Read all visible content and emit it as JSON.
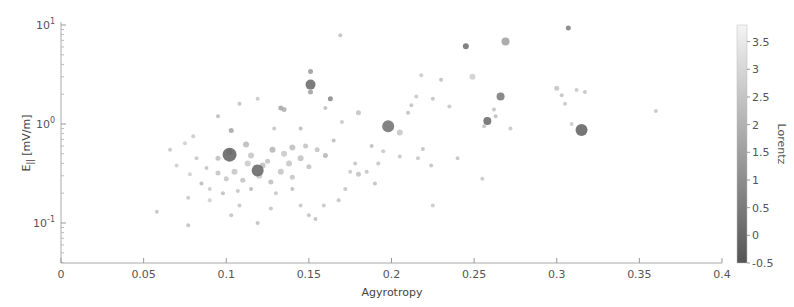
{
  "chart_data": {
    "type": "scatter",
    "title": "",
    "xlabel": "Agyrotropy",
    "ylabel": "E_|| [mV/m]",
    "xlim": [
      0,
      0.4
    ],
    "ylim": [
      0.04,
      10
    ],
    "yscale": "log",
    "grid": false,
    "x_ticks": [
      "0",
      "0.05",
      "0.1",
      "0.15",
      "0.2",
      "0.25",
      "0.3",
      "0.35",
      "0.4"
    ],
    "y_ticks": [
      "10^-1",
      "10^0",
      "10^1"
    ],
    "colorbar": {
      "label": "Lorentz",
      "range": [
        -0.5,
        3.8
      ],
      "ticks": [
        "-0.5",
        "0",
        "0.5",
        "1",
        "1.5",
        "2",
        "2.5",
        "3",
        "3.5"
      ],
      "colormap": "gray (dark = low, light = high)"
    },
    "points": [
      {
        "x": 0.102,
        "y": 0.49,
        "c": 0.0,
        "s": 7
      },
      {
        "x": 0.119,
        "y": 0.34,
        "c": 0.1,
        "s": 6
      },
      {
        "x": 0.151,
        "y": 2.5,
        "c": 0.2,
        "s": 5
      },
      {
        "x": 0.198,
        "y": 0.95,
        "c": 0.4,
        "s": 6
      },
      {
        "x": 0.258,
        "y": 1.07,
        "c": 0.2,
        "s": 4
      },
      {
        "x": 0.266,
        "y": 1.9,
        "c": 0.6,
        "s": 4
      },
      {
        "x": 0.315,
        "y": 0.87,
        "c": 0.0,
        "s": 6
      },
      {
        "x": 0.245,
        "y": 6.1,
        "c": 0.3,
        "s": 3
      },
      {
        "x": 0.269,
        "y": 6.8,
        "c": 1.6,
        "s": 4
      },
      {
        "x": 0.307,
        "y": 9.3,
        "c": 0.8,
        "s": 2.5
      },
      {
        "x": 0.151,
        "y": 3.4,
        "c": 1.5,
        "s": 2.5
      },
      {
        "x": 0.151,
        "y": 2.1,
        "c": 1.6,
        "s": 2.5
      },
      {
        "x": 0.163,
        "y": 1.8,
        "c": 1.0,
        "s": 2.5
      },
      {
        "x": 0.169,
        "y": 7.9,
        "c": 2.4,
        "s": 2
      },
      {
        "x": 0.135,
        "y": 1.4,
        "c": 2.0,
        "s": 2.5
      },
      {
        "x": 0.133,
        "y": 1.45,
        "c": 1.8,
        "s": 2.5
      },
      {
        "x": 0.103,
        "y": 0.86,
        "c": 1.8,
        "s": 2.5
      },
      {
        "x": 0.102,
        "y": 0.52,
        "c": 2.0,
        "s": 3
      },
      {
        "x": 0.095,
        "y": 1.2,
        "c": 2.3,
        "s": 2
      },
      {
        "x": 0.112,
        "y": 0.62,
        "c": 2.3,
        "s": 3
      },
      {
        "x": 0.122,
        "y": 0.38,
        "c": 2.4,
        "s": 3
      },
      {
        "x": 0.128,
        "y": 0.55,
        "c": 2.2,
        "s": 3
      },
      {
        "x": 0.14,
        "y": 0.58,
        "c": 2.4,
        "s": 3
      },
      {
        "x": 0.145,
        "y": 0.45,
        "c": 2.5,
        "s": 3
      },
      {
        "x": 0.133,
        "y": 0.33,
        "c": 2.6,
        "s": 3
      },
      {
        "x": 0.113,
        "y": 0.4,
        "c": 2.7,
        "s": 3
      },
      {
        "x": 0.105,
        "y": 0.33,
        "c": 2.6,
        "s": 3
      },
      {
        "x": 0.095,
        "y": 0.32,
        "c": 2.5,
        "s": 2.5
      },
      {
        "x": 0.1,
        "y": 0.28,
        "c": 2.6,
        "s": 2.5
      },
      {
        "x": 0.11,
        "y": 0.27,
        "c": 2.5,
        "s": 2.5
      },
      {
        "x": 0.12,
        "y": 0.3,
        "c": 2.7,
        "s": 3
      },
      {
        "x": 0.127,
        "y": 0.26,
        "c": 2.4,
        "s": 2.5
      },
      {
        "x": 0.14,
        "y": 0.29,
        "c": 2.6,
        "s": 2.5
      },
      {
        "x": 0.15,
        "y": 0.37,
        "c": 2.5,
        "s": 2.5
      },
      {
        "x": 0.155,
        "y": 0.55,
        "c": 2.5,
        "s": 2.5
      },
      {
        "x": 0.16,
        "y": 0.48,
        "c": 2.2,
        "s": 2.5
      },
      {
        "x": 0.088,
        "y": 0.36,
        "c": 2.5,
        "s": 2
      },
      {
        "x": 0.085,
        "y": 0.25,
        "c": 2.3,
        "s": 2
      },
      {
        "x": 0.09,
        "y": 0.22,
        "c": 2.7,
        "s": 2
      },
      {
        "x": 0.098,
        "y": 0.2,
        "c": 2.4,
        "s": 2
      },
      {
        "x": 0.107,
        "y": 0.21,
        "c": 2.5,
        "s": 2
      },
      {
        "x": 0.115,
        "y": 0.22,
        "c": 2.2,
        "s": 2
      },
      {
        "x": 0.13,
        "y": 0.2,
        "c": 2.6,
        "s": 2
      },
      {
        "x": 0.14,
        "y": 0.22,
        "c": 2.4,
        "s": 2
      },
      {
        "x": 0.078,
        "y": 0.31,
        "c": 2.8,
        "s": 2
      },
      {
        "x": 0.082,
        "y": 0.45,
        "c": 2.6,
        "s": 2
      },
      {
        "x": 0.075,
        "y": 0.64,
        "c": 2.8,
        "s": 2
      },
      {
        "x": 0.066,
        "y": 0.55,
        "c": 2.6,
        "s": 2
      },
      {
        "x": 0.058,
        "y": 0.13,
        "c": 2.5,
        "s": 2
      },
      {
        "x": 0.077,
        "y": 0.095,
        "c": 2.4,
        "s": 2
      },
      {
        "x": 0.077,
        "y": 0.18,
        "c": 2.6,
        "s": 2
      },
      {
        "x": 0.09,
        "y": 0.17,
        "c": 2.8,
        "s": 2
      },
      {
        "x": 0.103,
        "y": 0.12,
        "c": 2.5,
        "s": 2
      },
      {
        "x": 0.108,
        "y": 0.15,
        "c": 2.6,
        "s": 2
      },
      {
        "x": 0.119,
        "y": 0.1,
        "c": 2.4,
        "s": 2
      },
      {
        "x": 0.127,
        "y": 0.14,
        "c": 2.5,
        "s": 2
      },
      {
        "x": 0.145,
        "y": 0.15,
        "c": 2.6,
        "s": 2
      },
      {
        "x": 0.15,
        "y": 0.12,
        "c": 2.5,
        "s": 2
      },
      {
        "x": 0.154,
        "y": 0.11,
        "c": 2.4,
        "s": 2
      },
      {
        "x": 0.159,
        "y": 0.15,
        "c": 2.6,
        "s": 2
      },
      {
        "x": 0.168,
        "y": 0.17,
        "c": 2.5,
        "s": 2
      },
      {
        "x": 0.172,
        "y": 0.22,
        "c": 2.5,
        "s": 2
      },
      {
        "x": 0.18,
        "y": 0.31,
        "c": 2.5,
        "s": 2.5
      },
      {
        "x": 0.175,
        "y": 0.33,
        "c": 2.6,
        "s": 2
      },
      {
        "x": 0.19,
        "y": 0.25,
        "c": 2.4,
        "s": 2
      },
      {
        "x": 0.192,
        "y": 0.4,
        "c": 2.5,
        "s": 2
      },
      {
        "x": 0.195,
        "y": 0.53,
        "c": 2.6,
        "s": 2
      },
      {
        "x": 0.205,
        "y": 0.82,
        "c": 2.6,
        "s": 3
      },
      {
        "x": 0.21,
        "y": 1.3,
        "c": 2.4,
        "s": 2
      },
      {
        "x": 0.212,
        "y": 1.55,
        "c": 2.5,
        "s": 2
      },
      {
        "x": 0.215,
        "y": 1.9,
        "c": 2.6,
        "s": 2
      },
      {
        "x": 0.218,
        "y": 3.1,
        "c": 2.7,
        "s": 2
      },
      {
        "x": 0.225,
        "y": 1.8,
        "c": 2.5,
        "s": 2
      },
      {
        "x": 0.23,
        "y": 2.8,
        "c": 2.4,
        "s": 2
      },
      {
        "x": 0.235,
        "y": 1.5,
        "c": 2.6,
        "s": 2
      },
      {
        "x": 0.24,
        "y": 0.45,
        "c": 2.5,
        "s": 2
      },
      {
        "x": 0.249,
        "y": 3.0,
        "c": 2.8,
        "s": 3
      },
      {
        "x": 0.256,
        "y": 0.95,
        "c": 2.5,
        "s": 2
      },
      {
        "x": 0.262,
        "y": 1.4,
        "c": 2.5,
        "s": 2
      },
      {
        "x": 0.263,
        "y": 1.2,
        "c": 2.4,
        "s": 2
      },
      {
        "x": 0.255,
        "y": 0.28,
        "c": 2.6,
        "s": 2
      },
      {
        "x": 0.272,
        "y": 0.9,
        "c": 2.6,
        "s": 2
      },
      {
        "x": 0.225,
        "y": 0.15,
        "c": 2.7,
        "s": 2
      },
      {
        "x": 0.224,
        "y": 0.38,
        "c": 2.5,
        "s": 2
      },
      {
        "x": 0.219,
        "y": 0.56,
        "c": 2.5,
        "s": 2
      },
      {
        "x": 0.216,
        "y": 0.45,
        "c": 2.6,
        "s": 2
      },
      {
        "x": 0.205,
        "y": 0.47,
        "c": 2.6,
        "s": 2
      },
      {
        "x": 0.188,
        "y": 0.6,
        "c": 2.4,
        "s": 2
      },
      {
        "x": 0.18,
        "y": 1.3,
        "c": 2.5,
        "s": 2.5
      },
      {
        "x": 0.17,
        "y": 1.05,
        "c": 2.6,
        "s": 2
      },
      {
        "x": 0.165,
        "y": 0.68,
        "c": 2.3,
        "s": 2
      },
      {
        "x": 0.178,
        "y": 0.4,
        "c": 2.5,
        "s": 2
      },
      {
        "x": 0.185,
        "y": 0.33,
        "c": 2.5,
        "s": 2
      },
      {
        "x": 0.16,
        "y": 1.45,
        "c": 2.4,
        "s": 2
      },
      {
        "x": 0.145,
        "y": 0.9,
        "c": 2.3,
        "s": 2
      },
      {
        "x": 0.129,
        "y": 0.9,
        "c": 2.5,
        "s": 2
      },
      {
        "x": 0.119,
        "y": 1.8,
        "c": 2.6,
        "s": 2
      },
      {
        "x": 0.108,
        "y": 1.6,
        "c": 2.4,
        "s": 2
      },
      {
        "x": 0.3,
        "y": 2.3,
        "c": 2.5,
        "s": 2.5
      },
      {
        "x": 0.303,
        "y": 1.95,
        "c": 2.5,
        "s": 2
      },
      {
        "x": 0.305,
        "y": 1.6,
        "c": 2.6,
        "s": 2
      },
      {
        "x": 0.312,
        "y": 2.2,
        "c": 2.6,
        "s": 2
      },
      {
        "x": 0.317,
        "y": 2.1,
        "c": 2.5,
        "s": 2
      },
      {
        "x": 0.309,
        "y": 1.0,
        "c": 2.7,
        "s": 2
      },
      {
        "x": 0.36,
        "y": 1.35,
        "c": 2.6,
        "s": 2
      },
      {
        "x": 0.08,
        "y": 0.75,
        "c": 2.7,
        "s": 2
      },
      {
        "x": 0.07,
        "y": 0.38,
        "c": 2.8,
        "s": 2
      },
      {
        "x": 0.095,
        "y": 0.45,
        "c": 2.4,
        "s": 2.5
      },
      {
        "x": 0.115,
        "y": 0.48,
        "c": 2.6,
        "s": 3
      },
      {
        "x": 0.135,
        "y": 0.5,
        "c": 2.7,
        "s": 3
      },
      {
        "x": 0.125,
        "y": 0.42,
        "c": 2.5,
        "s": 2.5
      },
      {
        "x": 0.138,
        "y": 0.4,
        "c": 2.6,
        "s": 3
      },
      {
        "x": 0.148,
        "y": 0.6,
        "c": 2.5,
        "s": 2.5
      }
    ]
  },
  "axes": {
    "x_title": "Agyrotropy",
    "y_title_main": "E",
    "y_title_sub": "||",
    "y_title_unit": " [mV/m]",
    "x_tick_labels": [
      "0",
      "0.05",
      "0.1",
      "0.15",
      "0.2",
      "0.25",
      "0.3",
      "0.35",
      "0.4"
    ],
    "y_tick_labels": [
      {
        "base": "10",
        "exp": "1"
      },
      {
        "base": "10",
        "exp": "0"
      },
      {
        "base": "10",
        "exp": "-1"
      }
    ]
  },
  "colorbar": {
    "label": "Lorentz",
    "tick_labels": [
      "3.5",
      "3",
      "2.5",
      "2",
      "1.5",
      "1",
      "0.5",
      "0",
      "-0.5"
    ],
    "min": -0.5,
    "max": 3.8,
    "dark_color": "#555555",
    "light_color": "#f4f4f4"
  }
}
